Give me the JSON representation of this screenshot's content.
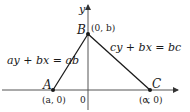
{
  "diagram": {
    "axes": {
      "x_label": "x",
      "y_label": "y",
      "origin_label": "0"
    },
    "points": [
      {
        "name": "A",
        "coord_label": "(a, 0)"
      },
      {
        "name": "B",
        "coord_label": "(0, b)"
      },
      {
        "name": "C",
        "coord_label": "(c, 0)"
      }
    ],
    "lines": [
      {
        "from": "A",
        "to": "B",
        "equation": "ay + bx = ab"
      },
      {
        "from": "B",
        "to": "C",
        "equation": "cy + bx = bc"
      }
    ],
    "colors": {
      "stroke": "#1a1a1a",
      "axis": "#555555",
      "background": "#ffffff"
    }
  }
}
